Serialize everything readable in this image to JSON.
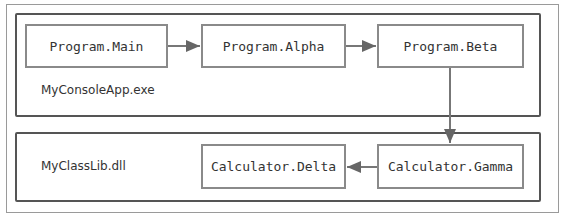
{
  "diagram": {
    "containers": [
      {
        "id": "console",
        "label": "MyConsoleApp.exe"
      },
      {
        "id": "classlib",
        "label": "MyClassLib.dll"
      }
    ],
    "nodes": {
      "main": "Program.Main",
      "alpha": "Program.Alpha",
      "beta": "Program.Beta",
      "gamma": "Calculator.Gamma",
      "delta": "Calculator.Delta"
    },
    "edges": [
      {
        "from": "Program.Main",
        "to": "Program.Alpha"
      },
      {
        "from": "Program.Alpha",
        "to": "Program.Beta"
      },
      {
        "from": "Program.Beta",
        "to": "Calculator.Gamma"
      },
      {
        "from": "Calculator.Gamma",
        "to": "Calculator.Delta"
      }
    ],
    "colors": {
      "container_border": "#555555",
      "node_border": "#8a8a8a",
      "arrow": "#666666",
      "text": "#333333"
    }
  }
}
